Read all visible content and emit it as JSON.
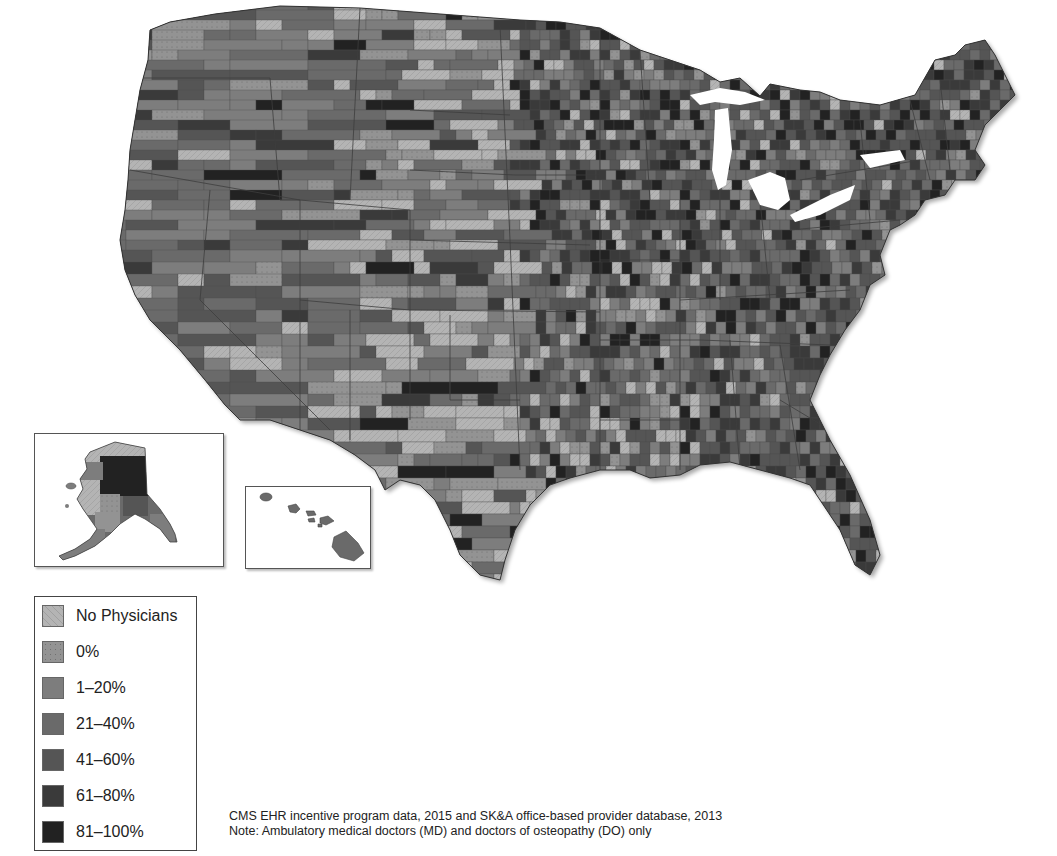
{
  "map": {
    "subject": "Percentage of office-based physicians participating in CMS EHR incentive program, by county",
    "region": "United States (contiguous) with Alaska and Hawaii insets",
    "insets": [
      {
        "name": "Alaska"
      },
      {
        "name": "Hawaii"
      }
    ],
    "colors": {
      "background": "#ffffff",
      "state_outline": "#444444",
      "lake": "#ffffff"
    }
  },
  "legend": {
    "items": [
      {
        "label": "No Physicians",
        "color": "#b4b4b4"
      },
      {
        "label": "0%",
        "color": "#939393"
      },
      {
        "label": "1–20%",
        "color": "#7d7d7d"
      },
      {
        "label": "21–40%",
        "color": "#6a6a6a"
      },
      {
        "label": "41–60%",
        "color": "#555555"
      },
      {
        "label": "61–80%",
        "color": "#3a3a3a"
      },
      {
        "label": "81–100%",
        "color": "#222222"
      }
    ]
  },
  "caption": {
    "source": "CMS EHR incentive program data, 2015 and SK&A office-based provider database, 2013",
    "note": "Note: Ambulatory medical doctors (MD) and doctors of osteopathy (DO) only"
  }
}
